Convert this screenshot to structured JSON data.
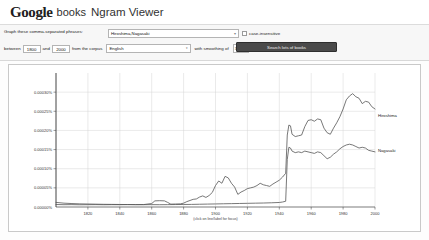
{
  "header": {
    "logo_google": "Google",
    "logo_books": "books",
    "title": "Ngram Viewer"
  },
  "query_panel": {
    "phrases_label": "Graph these comma-separated phrases:",
    "query_value": "Hiroshima,Nagasaki",
    "query_placeholder": "Enter comma-separated phrases",
    "case_insensitive_label": "case-insensitive",
    "case_insensitive_checked": false,
    "between_label": "between",
    "year_start": "1800",
    "and_label": "and",
    "year_end": "2000",
    "corpus_label": "from the corpus",
    "corpus_value": "English",
    "smoothing_label": "with smoothing of",
    "smoothing_value": "3",
    "search_button": "Search lots of books",
    "dropdown_caret": "▾"
  },
  "chart_data": {
    "type": "line",
    "title": "",
    "xlabel": "",
    "ylabel": "",
    "footnote": "(click on line/label for focus)",
    "grid": true,
    "legend_position": "right",
    "xlim": [
      1800,
      2000
    ],
    "ylim": [
      0,
      0.00035
    ],
    "xticks": [
      1820,
      1840,
      1860,
      1880,
      1900,
      1920,
      1940,
      1960,
      1980,
      2000
    ],
    "xtick_labels": [
      "1820",
      "1840",
      "1860",
      "1880",
      "1900",
      "1920",
      "1940",
      "1960",
      "1980",
      "2000"
    ],
    "yticks": [
      5e-05,
      0.0001,
      0.00015,
      0.0002,
      0.00025,
      0.0003
    ],
    "ytick_labels": [
      "0.00005%",
      "0.00010%",
      "0.00015%",
      "0.00020%",
      "0.00025%",
      "0.00030%"
    ],
    "series": [
      {
        "name": "Hiroshima",
        "color": "#555555",
        "x": [
          1800,
          1805,
          1810,
          1815,
          1820,
          1825,
          1830,
          1835,
          1840,
          1845,
          1850,
          1855,
          1860,
          1862,
          1865,
          1868,
          1870,
          1872,
          1875,
          1878,
          1880,
          1882,
          1884,
          1886,
          1888,
          1890,
          1892,
          1894,
          1896,
          1898,
          1900,
          1902,
          1904,
          1906,
          1908,
          1910,
          1912,
          1914,
          1916,
          1918,
          1920,
          1922,
          1924,
          1926,
          1928,
          1930,
          1932,
          1934,
          1936,
          1938,
          1940,
          1942,
          1944,
          1945,
          1946,
          1947,
          1948,
          1950,
          1952,
          1954,
          1956,
          1958,
          1960,
          1962,
          1964,
          1966,
          1968,
          1970,
          1972,
          1974,
          1976,
          1978,
          1980,
          1982,
          1984,
          1986,
          1988,
          1990,
          1992,
          1994,
          1996,
          1998,
          2000
        ],
        "values": [
          6.5e-06,
          6e-06,
          6.2e-06,
          5.8e-06,
          6e-06,
          6.2e-06,
          5.9e-06,
          6.1e-06,
          6e-06,
          6.3e-06,
          6.2e-06,
          6.4e-06,
          9e-06,
          1.6e-05,
          1.65e-05,
          1.6e-05,
          1.2e-05,
          7.5e-06,
          7.8e-06,
          8.2e-06,
          1e-05,
          1.4e-05,
          1.7e-05,
          2e-05,
          2.1e-05,
          2.6e-05,
          2.9e-05,
          2.5e-05,
          3e-05,
          3.8e-05,
          5.6e-05,
          6.8e-05,
          6.2e-05,
          8e-05,
          7.6e-05,
          6.2e-05,
          5.2e-05,
          3.3e-05,
          3.9e-05,
          4.3e-05,
          4.8e-05,
          5e-05,
          5.2e-05,
          5.6e-05,
          6.2e-05,
          5.8e-05,
          5.6e-05,
          5.4e-05,
          6e-05,
          6.5e-05,
          7e-05,
          7.8e-05,
          8.8e-05,
          0.000188,
          0.000214,
          0.000212,
          0.00019,
          0.000184,
          0.000186,
          0.000188,
          0.00021,
          0.000226,
          0.000228,
          0.000224,
          0.00023,
          0.000228,
          0.000206,
          0.000194,
          0.00019,
          0.000206,
          0.00022,
          0.000236,
          0.000256,
          0.00028,
          0.00029,
          0.000296,
          0.000288,
          0.000284,
          0.00027,
          0.000276,
          0.000274,
          0.000262,
          0.000256
        ],
        "label_y": 0.00024
      },
      {
        "name": "Nagasaki",
        "color": "#555555",
        "x": [
          1800,
          1805,
          1810,
          1815,
          1820,
          1825,
          1830,
          1835,
          1840,
          1845,
          1850,
          1855,
          1860,
          1865,
          1870,
          1875,
          1880,
          1885,
          1890,
          1895,
          1900,
          1905,
          1910,
          1915,
          1920,
          1925,
          1930,
          1935,
          1940,
          1942,
          1944,
          1945,
          1946,
          1947,
          1948,
          1950,
          1952,
          1954,
          1956,
          1958,
          1960,
          1962,
          1964,
          1966,
          1968,
          1970,
          1972,
          1974,
          1976,
          1978,
          1980,
          1982,
          1984,
          1986,
          1988,
          1990,
          1992,
          1994,
          1996,
          1998,
          2000
        ],
        "values": [
          1.2e-05,
          1e-05,
          9e-06,
          8.2e-06,
          7.8e-06,
          7.4e-06,
          7e-06,
          6.8e-06,
          6.6e-06,
          6.4e-06,
          6.2e-06,
          6e-06,
          6.2e-06,
          6e-06,
          6.2e-06,
          6.4e-06,
          6.6e-06,
          6.8e-06,
          7.2e-06,
          7.6e-06,
          8e-06,
          8.4e-06,
          8.8e-06,
          9.2e-06,
          9.6e-06,
          1e-05,
          1.04e-05,
          1.1e-05,
          1.18e-05,
          1.3e-05,
          1.5e-05,
          0.000124,
          0.000156,
          0.000154,
          0.000146,
          0.000142,
          0.000144,
          0.000142,
          0.000146,
          0.000144,
          0.000142,
          0.00014,
          0.000144,
          0.000142,
          0.000134,
          0.000126,
          0.00013,
          0.000138,
          0.000144,
          0.000152,
          0.000158,
          0.000162,
          0.000164,
          0.000162,
          0.000158,
          0.000154,
          0.000156,
          0.000154,
          0.000148,
          0.000146,
          0.000144
        ],
        "label_y": 0.000148
      }
    ]
  }
}
